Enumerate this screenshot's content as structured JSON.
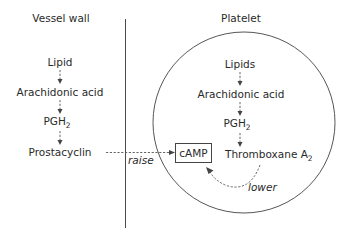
{
  "diagram": {
    "regions": {
      "vessel_wall": {
        "title": "Vessel wall"
      },
      "platelet": {
        "title": "Platelet"
      }
    },
    "vessel_pathway": {
      "steps": [
        {
          "label": "Lipid",
          "sub": ""
        },
        {
          "label": "Arachidonic acid",
          "sub": ""
        },
        {
          "label": "PGH",
          "sub": "2"
        },
        {
          "label": "Prostacyclin",
          "sub": ""
        }
      ]
    },
    "platelet_pathway": {
      "steps": [
        {
          "label": "Lipids",
          "sub": ""
        },
        {
          "label": "Arachidonic acid",
          "sub": ""
        },
        {
          "label": "PGH",
          "sub": "2"
        },
        {
          "label": "Thromboxane A",
          "sub": "2"
        }
      ]
    },
    "camp_box": {
      "label": "cAMP"
    },
    "effects": {
      "raise": {
        "label": "raise",
        "from": "Prostacyclin",
        "to": "cAMP"
      },
      "lower": {
        "label": "lower",
        "from": "Thromboxane A2",
        "to": "cAMP"
      }
    }
  }
}
